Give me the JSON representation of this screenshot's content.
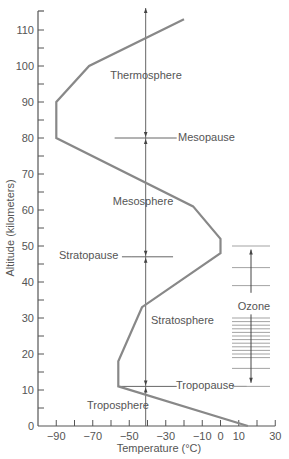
{
  "chart_data": {
    "type": "line",
    "title": "",
    "xlabel": "Temperature (°C)",
    "ylabel": "Altitude (kilometers)",
    "xlim": [
      -100,
      30
    ],
    "ylim": [
      0,
      115
    ],
    "x_ticks": [
      -90,
      -70,
      -50,
      -30,
      -10,
      0,
      10,
      30
    ],
    "x_tick_labels": [
      "−90",
      "−70",
      "−50",
      "−30",
      "−10",
      "0",
      "10",
      "30"
    ],
    "y_ticks": [
      0,
      10,
      20,
      30,
      40,
      50,
      60,
      70,
      80,
      90,
      100,
      110
    ],
    "y_tick_labels": [
      "0",
      "10",
      "20",
      "30",
      "40",
      "50",
      "60",
      "70",
      "80",
      "90",
      "100",
      "110"
    ],
    "grid": false,
    "series": [
      {
        "name": "Temperature profile",
        "points": [
          {
            "temp": 15,
            "alt": 0
          },
          {
            "temp": -56,
            "alt": 11
          },
          {
            "temp": -56,
            "alt": 18
          },
          {
            "temp": -43,
            "alt": 33
          },
          {
            "temp": 0,
            "alt": 48
          },
          {
            "temp": 0,
            "alt": 52
          },
          {
            "temp": -15,
            "alt": 61
          },
          {
            "temp": -90,
            "alt": 80
          },
          {
            "temp": -90,
            "alt": 90
          },
          {
            "temp": -72,
            "alt": 100
          },
          {
            "temp": -20,
            "alt": 113
          }
        ]
      }
    ],
    "reference_line": {
      "temp": -41,
      "alt_range": [
        0,
        115
      ]
    },
    "layers": [
      {
        "name": "Troposphere",
        "label_alt": 6
      },
      {
        "name": "Tropopause",
        "alt": 11
      },
      {
        "name": "Stratosphere",
        "label_alt": 29
      },
      {
        "name": "Stratopause",
        "alt": 47
      },
      {
        "name": "Mesosphere",
        "label_alt": 64
      },
      {
        "name": "Mesopause",
        "alt": 80
      },
      {
        "name": "Thermosphere",
        "label_alt": 98
      }
    ],
    "annotations": [
      {
        "text": "Ozone",
        "alt_range": [
          11,
          50
        ],
        "band_lines_alt": [
          11,
          16,
          19,
          20,
          21,
          22,
          23,
          24,
          25,
          26,
          27,
          28,
          29,
          30,
          39,
          44,
          50
        ]
      }
    ]
  },
  "labels": {
    "xlabel": "Temperature (°C)",
    "ylabel": "Altitude (kilometers)",
    "thermosphere": "Thermosphere",
    "mesopause": "Mesopause",
    "mesosphere": "Mesosphere",
    "stratopause": "Stratopause",
    "stratosphere": "Stratosphere",
    "tropopause": "Tropopause",
    "troposphere": "Troposphere",
    "ozone": "Ozone"
  },
  "colors": {
    "curve": "#888888",
    "axis": "#555555",
    "text": "#555555",
    "lines": "#666666"
  }
}
